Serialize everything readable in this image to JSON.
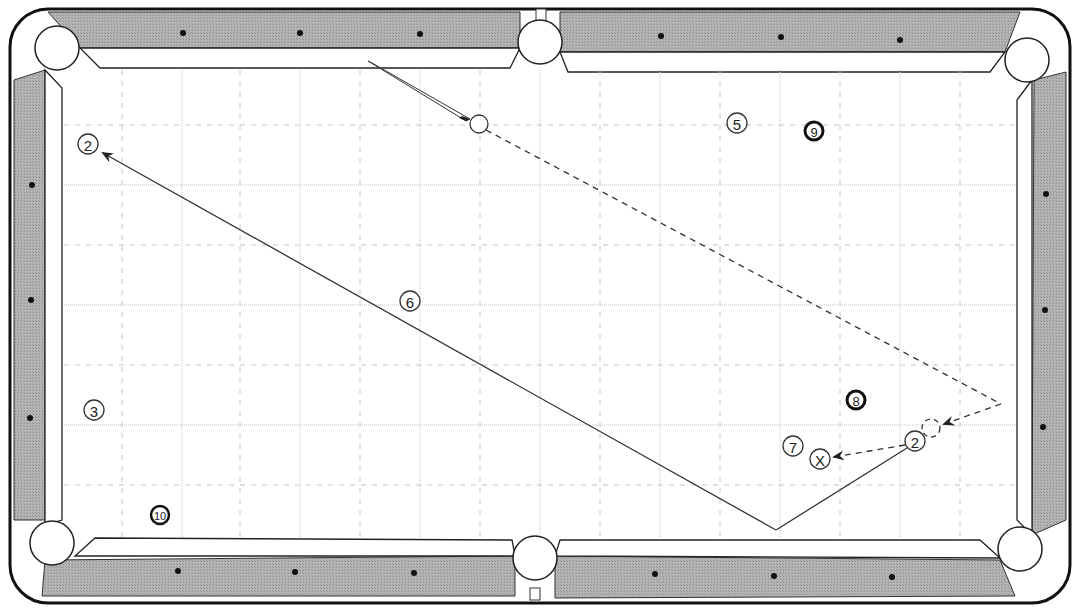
{
  "diagram": {
    "colors": {
      "rail": "#a9a9a9",
      "cloth": "#ffffff",
      "line": "#333333",
      "grid": "#bbbbbb",
      "diamond": "#111111"
    },
    "balls": [
      {
        "id": "ball-2-start",
        "label": "2",
        "x": 88,
        "y": 144,
        "style": "outline"
      },
      {
        "id": "ball-5",
        "label": "5",
        "x": 737,
        "y": 123,
        "style": "outline"
      },
      {
        "id": "ball-9",
        "label": "9",
        "x": 814,
        "y": 131,
        "style": "bold"
      },
      {
        "id": "ball-6",
        "label": "6",
        "x": 410,
        "y": 301,
        "style": "outline"
      },
      {
        "id": "ball-3",
        "label": "3",
        "x": 94,
        "y": 410,
        "style": "outline"
      },
      {
        "id": "ball-8",
        "label": "8",
        "x": 856,
        "y": 400,
        "style": "bold"
      },
      {
        "id": "ball-7",
        "label": "7",
        "x": 793,
        "y": 446,
        "style": "outline"
      },
      {
        "id": "ball-x",
        "label": "X",
        "x": 820,
        "y": 459,
        "style": "outline"
      },
      {
        "id": "ball-2-object",
        "label": "2",
        "x": 915,
        "y": 441,
        "style": "outline"
      },
      {
        "id": "ball-10",
        "label": "10",
        "x": 160,
        "y": 515,
        "style": "bold"
      }
    ],
    "cue_ball": {
      "x": 479,
      "y": 124
    },
    "ghost_ball": {
      "x": 931,
      "y": 428
    },
    "pockets": [
      {
        "name": "top-left",
        "x": 57,
        "y": 48
      },
      {
        "name": "top-middle",
        "x": 540,
        "y": 40
      },
      {
        "name": "top-right",
        "x": 1027,
        "y": 60
      },
      {
        "name": "bottom-left",
        "x": 52,
        "y": 543
      },
      {
        "name": "bottom-middle",
        "x": 535,
        "y": 560
      },
      {
        "name": "bottom-right",
        "x": 1020,
        "y": 549
      }
    ],
    "paths": {
      "object_ball_path": "2 ball banks off bottom rail and travels to top-left",
      "cue_ball_path": "cue ball banks off right rail into ghost position, then to X"
    }
  }
}
